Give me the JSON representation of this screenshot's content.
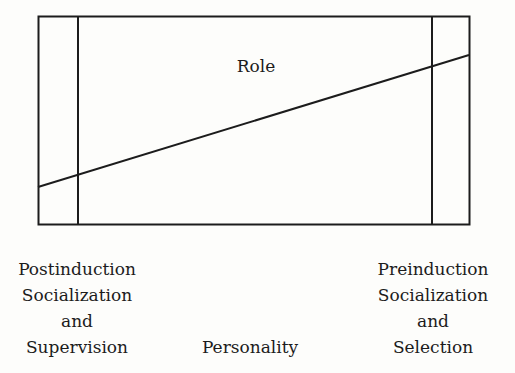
{
  "diagram": {
    "inner_label": "Role",
    "bottom_labels": {
      "left": [
        "Postinduction",
        "Socialization",
        "and",
        "Supervision"
      ],
      "center": "Personality",
      "right": [
        "Preinduction",
        "Socialization",
        "and",
        "Selection"
      ]
    },
    "colors": {
      "line": "#1c1c1c",
      "background": "#fdfdfb"
    }
  }
}
